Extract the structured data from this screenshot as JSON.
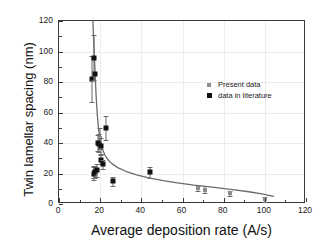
{
  "chart_data": {
    "type": "scatter",
    "title": "",
    "xlabel": "Average deposition rate (A/s)",
    "ylabel": "Twin lamellar spacing (nm)",
    "xlim": [
      0,
      120
    ],
    "ylim": [
      0,
      120
    ],
    "xticks": [
      0,
      20,
      40,
      60,
      80,
      100,
      120
    ],
    "yticks": [
      0,
      20,
      40,
      60,
      80,
      100,
      120
    ],
    "xtick_labels": [
      "0",
      "20",
      "40",
      "60",
      "80",
      "100",
      "120"
    ],
    "ytick_labels": [
      "0",
      "20",
      "40",
      "60",
      "80",
      "100",
      "120"
    ],
    "grid": true,
    "legend_position": "upper-right-inside",
    "series": [
      {
        "name": "Present data",
        "marker": "square",
        "color": "#8d8d8d",
        "points": [
          {
            "x": 17.0,
            "y": 21.0,
            "yerr": 4.0
          },
          {
            "x": 19.2,
            "y": 40.0,
            "yerr": 6.0
          },
          {
            "x": 19.8,
            "y": 43.0,
            "yerr": 7.0
          },
          {
            "x": 67.5,
            "y": 10.5,
            "yerr": 2.0
          },
          {
            "x": 71.0,
            "y": 9.5,
            "yerr": 2.5
          },
          {
            "x": 83.0,
            "y": 7.0,
            "yerr": 1.5
          },
          {
            "x": 100.0,
            "y": 3.0,
            "yerr": 1.5
          }
        ]
      },
      {
        "name": "data in literature",
        "marker": "square",
        "color": "#111111",
        "points": [
          {
            "x": 16.0,
            "y": 82.0,
            "yerr": 15.0
          },
          {
            "x": 17.2,
            "y": 96.0,
            "yerr": 15.0
          },
          {
            "x": 17.6,
            "y": 85.0,
            "yerr": 0.0
          },
          {
            "x": 16.8,
            "y": 20.0,
            "yerr": 4.0
          },
          {
            "x": 17.4,
            "y": 21.0,
            "yerr": 4.0
          },
          {
            "x": 18.4,
            "y": 22.0,
            "yerr": 4.0
          },
          {
            "x": 19.0,
            "y": 40.0,
            "yerr": 5.0
          },
          {
            "x": 19.6,
            "y": 39.5,
            "yerr": 0.0
          },
          {
            "x": 20.6,
            "y": 38.0,
            "yerr": 5.0
          },
          {
            "x": 20.2,
            "y": 29.0,
            "yerr": 3.0
          },
          {
            "x": 21.6,
            "y": 26.0,
            "yerr": 3.0
          },
          {
            "x": 22.6,
            "y": 50.0,
            "yerr": 8.0
          },
          {
            "x": 26.0,
            "y": 15.0,
            "yerr": 3.0
          },
          {
            "x": 44.0,
            "y": 20.8,
            "yerr": 3.5
          }
        ]
      }
    ],
    "fit_curve": {
      "label": "",
      "color": "#6a6a6a",
      "points": [
        {
          "x": 16.6,
          "y": 120.0
        },
        {
          "x": 17.2,
          "y": 100.0
        },
        {
          "x": 17.7,
          "y": 85.0
        },
        {
          "x": 18.2,
          "y": 70.0
        },
        {
          "x": 18.8,
          "y": 57.0
        },
        {
          "x": 19.4,
          "y": 48.0
        },
        {
          "x": 20.2,
          "y": 41.0
        },
        {
          "x": 21.2,
          "y": 35.5
        },
        {
          "x": 22.5,
          "y": 31.0
        },
        {
          "x": 24.0,
          "y": 28.0
        },
        {
          "x": 26.0,
          "y": 25.3
        },
        {
          "x": 29.0,
          "y": 22.6
        },
        {
          "x": 33.0,
          "y": 20.2
        },
        {
          "x": 38.0,
          "y": 18.0
        },
        {
          "x": 44.0,
          "y": 16.0
        },
        {
          "x": 51.0,
          "y": 14.2
        },
        {
          "x": 58.0,
          "y": 12.7
        },
        {
          "x": 66.0,
          "y": 11.2
        },
        {
          "x": 75.0,
          "y": 9.8
        },
        {
          "x": 85.0,
          "y": 8.2
        },
        {
          "x": 93.0,
          "y": 6.8
        },
        {
          "x": 100.0,
          "y": 5.2
        },
        {
          "x": 105.0,
          "y": 3.8
        }
      ]
    }
  },
  "legend": {
    "entries": [
      {
        "label": "Present data"
      },
      {
        "label": "data in literature"
      }
    ]
  }
}
